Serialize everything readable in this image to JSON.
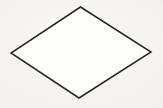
{
  "document": {
    "kind": "scanned-line-drawing",
    "title": "Rhombus",
    "caption": "",
    "width": 163,
    "height": 108
  },
  "canvas": {
    "width": 163,
    "height": 108,
    "background_color": "#f7f6f4",
    "paper_tint_color": "#f4f2ef",
    "paper_highlight_color": "#fbfaf8"
  },
  "figure": {
    "name": "rhombus",
    "shape_type": "quadrilateral",
    "shape_subtype": "rhombus",
    "label": "",
    "fill_color": "#fdfdfc",
    "stroke_color": "#2a2724",
    "stroke_width": 1.5,
    "stroke_style": "solid",
    "stroke_linejoin": "miter",
    "points_attr": "80.5,7 151,52 79,98 11,53",
    "vertices": [
      {
        "name": "top-vertex",
        "x": 80.5,
        "y": 7
      },
      {
        "name": "right-vertex",
        "x": 151,
        "y": 52
      },
      {
        "name": "bottom-vertex",
        "x": 79,
        "y": 98
      },
      {
        "name": "left-vertex",
        "x": 11,
        "y": 53
      }
    ],
    "edges": [
      {
        "name": "upper-left-edge",
        "from": "left-vertex",
        "to": "top-vertex"
      },
      {
        "name": "upper-right-edge",
        "from": "top-vertex",
        "to": "right-vertex"
      },
      {
        "name": "lower-right-edge",
        "from": "right-vertex",
        "to": "bottom-vertex"
      },
      {
        "name": "lower-left-edge",
        "from": "bottom-vertex",
        "to": "left-vertex"
      }
    ],
    "diagonals": {
      "horizontal_length": 140,
      "vertical_length": 91
    }
  },
  "accessibility": {
    "description": "A hand-drawn rhombus (diamond) outline in dark ink on off-white paper."
  }
}
